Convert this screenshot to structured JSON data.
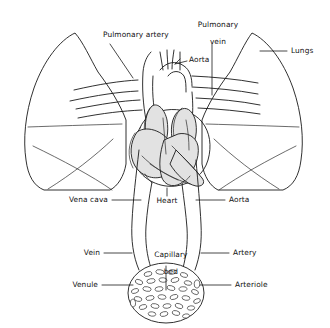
{
  "figure": {
    "background_color": "#ffffff",
    "line_color": "#1a1a1a",
    "chamber_fill_color": "#e2e2e2"
  },
  "labels": {
    "pulmonary_artery": "Pulmonary artery",
    "pulmonary_vein_line1": "Pulmonary",
    "pulmonary_vein_line2": "vein",
    "aorta_top": "Aorta",
    "lungs": "Lungs",
    "vena_cava": "Vena cava",
    "heart": "Heart",
    "aorta_bottom": "Aorta",
    "vein": "Vein",
    "capillary_bed_line1": "Capillary",
    "capillary_bed_line2": "bed",
    "artery": "Artery",
    "venule": "Venule",
    "arteriole": "Arteriole"
  },
  "structures": [
    {
      "name": "left-lung",
      "kind": "organ"
    },
    {
      "name": "right-lung",
      "kind": "organ"
    },
    {
      "name": "heart",
      "kind": "organ"
    },
    {
      "name": "aorta",
      "kind": "vessel"
    },
    {
      "name": "pulmonary-artery",
      "kind": "vessel"
    },
    {
      "name": "pulmonary-vein",
      "kind": "vessel"
    },
    {
      "name": "vena-cava",
      "kind": "vessel"
    },
    {
      "name": "vein",
      "kind": "vessel"
    },
    {
      "name": "artery",
      "kind": "vessel"
    },
    {
      "name": "venule",
      "kind": "vessel"
    },
    {
      "name": "arteriole",
      "kind": "vessel"
    },
    {
      "name": "capillary-bed",
      "kind": "vessel-network"
    }
  ]
}
